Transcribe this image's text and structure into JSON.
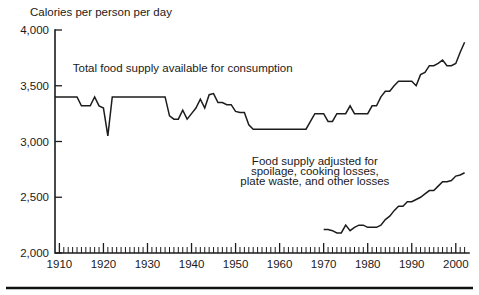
{
  "chart_data": {
    "type": "line",
    "title": "Calories per person per day",
    "xlabel": "",
    "ylabel": "Calories per person per day",
    "xlim": [
      1909,
      2003
    ],
    "ylim": [
      2000,
      4000
    ],
    "yticks": [
      2000,
      2500,
      3000,
      3500,
      4000
    ],
    "ytick_labels": [
      "2,000",
      "2,500",
      "3,000",
      "3,500",
      "4,000"
    ],
    "xticks": [
      1910,
      1920,
      1930,
      1940,
      1950,
      1960,
      1970,
      1980,
      1990,
      2000
    ],
    "xtick_labels": [
      "1910",
      "1920",
      "1930",
      "1940",
      "1950",
      "1960",
      "1970",
      "1980",
      "1990",
      "2000"
    ],
    "minor_xtick_step": 1,
    "grid": false,
    "legend": "inline-annotations",
    "annotations": [
      {
        "name": "total-supply-label",
        "text": "Total food supply available for consumption",
        "x": 1938,
        "y": 3620
      },
      {
        "name": "adjusted-supply-label-line1",
        "text": "Food supply adjusted for",
        "x": 1968,
        "y": 2790
      },
      {
        "name": "adjusted-supply-label-line2",
        "text": "spoilage, cooking losses,",
        "x": 1968,
        "y": 2700
      },
      {
        "name": "adjusted-supply-label-line3",
        "text": "plate waste, and other losses",
        "x": 1968,
        "y": 2610
      }
    ],
    "series": [
      {
        "name": "Total food supply available for consumption",
        "x": [
          1909,
          1910,
          1911,
          1912,
          1913,
          1914,
          1915,
          1916,
          1917,
          1918,
          1919,
          1920,
          1921,
          1922,
          1923,
          1924,
          1925,
          1926,
          1927,
          1928,
          1929,
          1930,
          1931,
          1932,
          1933,
          1934,
          1935,
          1936,
          1937,
          1938,
          1939,
          1940,
          1941,
          1942,
          1943,
          1944,
          1945,
          1946,
          1947,
          1948,
          1949,
          1950,
          1951,
          1952,
          1953,
          1954,
          1955,
          1956,
          1957,
          1958,
          1959,
          1960,
          1961,
          1962,
          1963,
          1964,
          1965,
          1966,
          1967,
          1968,
          1969,
          1970,
          1971,
          1972,
          1973,
          1974,
          1975,
          1976,
          1977,
          1978,
          1979,
          1980,
          1981,
          1982,
          1983,
          1984,
          1985,
          1986,
          1987,
          1988,
          1989,
          1990,
          1991,
          1992,
          1993,
          1994,
          1995,
          1996,
          1997,
          1998,
          1999,
          2000,
          2001,
          2002
        ],
        "y": [
          3400,
          3400,
          3400,
          3400,
          3400,
          3400,
          3320,
          3320,
          3320,
          3400,
          3320,
          3300,
          3050,
          3400,
          3400,
          3400,
          3400,
          3400,
          3400,
          3400,
          3400,
          3400,
          3400,
          3400,
          3400,
          3400,
          3230,
          3200,
          3200,
          3280,
          3200,
          3250,
          3300,
          3380,
          3300,
          3420,
          3430,
          3350,
          3350,
          3330,
          3330,
          3270,
          3260,
          3260,
          3150,
          3110,
          3110,
          3110,
          3110,
          3110,
          3110,
          3110,
          3110,
          3110,
          3110,
          3110,
          3110,
          3110,
          3180,
          3250,
          3250,
          3250,
          3180,
          3180,
          3250,
          3250,
          3250,
          3320,
          3250,
          3250,
          3250,
          3250,
          3320,
          3320,
          3400,
          3450,
          3450,
          3500,
          3540,
          3540,
          3540,
          3540,
          3500,
          3600,
          3620,
          3680,
          3680,
          3700,
          3730,
          3680,
          3680,
          3700,
          3800,
          3890
        ]
      },
      {
        "name": "Food supply adjusted for spoilage, cooking losses, plate waste, and other losses",
        "x": [
          1970,
          1971,
          1972,
          1973,
          1974,
          1975,
          1976,
          1977,
          1978,
          1979,
          1980,
          1981,
          1982,
          1983,
          1984,
          1985,
          1986,
          1987,
          1988,
          1989,
          1990,
          1991,
          1992,
          1993,
          1994,
          1995,
          1996,
          1997,
          1998,
          1999,
          2000,
          2001,
          2002
        ],
        "y": [
          2210,
          2210,
          2200,
          2180,
          2180,
          2250,
          2200,
          2230,
          2250,
          2250,
          2230,
          2230,
          2230,
          2250,
          2300,
          2330,
          2380,
          2420,
          2420,
          2460,
          2460,
          2480,
          2500,
          2530,
          2560,
          2560,
          2600,
          2640,
          2640,
          2650,
          2690,
          2700,
          2720
        ]
      }
    ]
  }
}
